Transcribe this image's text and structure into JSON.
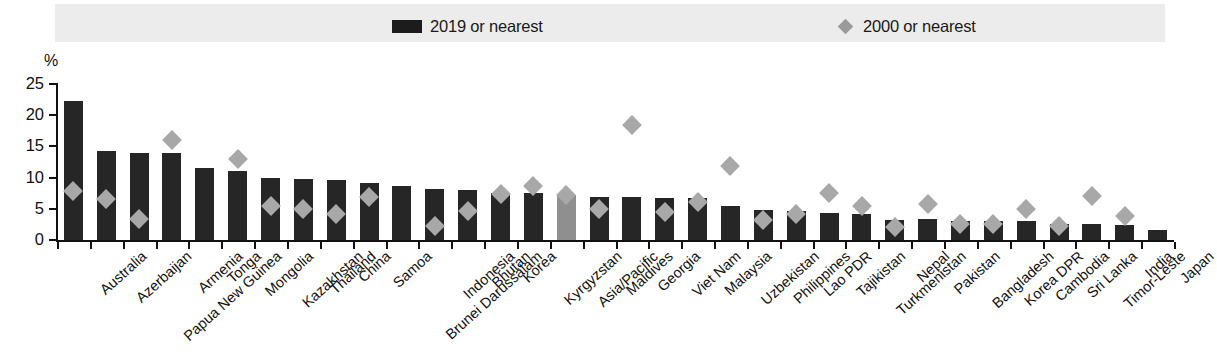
{
  "legend": {
    "items": [
      {
        "label": "2019 or nearest",
        "marker": "bar-swatch-icon",
        "color": "#262626"
      },
      {
        "label": "2000 or nearest",
        "marker": "diamond-marker-icon",
        "color": "#a8a8a8"
      }
    ]
  },
  "axis": {
    "unit_label": "%",
    "y_ticks": [
      "25",
      "20",
      "15",
      "10",
      "5",
      "0"
    ]
  },
  "chart_data": {
    "type": "bar",
    "title": "",
    "subtitle": "",
    "xlabel": "",
    "ylabel": "%",
    "ylim": [
      0,
      25
    ],
    "ytick_values": [
      0,
      5,
      10,
      15,
      20,
      25
    ],
    "grid": false,
    "legend_position": "top",
    "highlight_category": "Asia/Pacific",
    "highlight_color": "#8f8f8f",
    "categories": [
      "Australia",
      "Azerbaijan",
      "Papua New Guinea",
      "Armenia",
      "Tonga",
      "Mongolia",
      "Kazakhstan",
      "Thailand",
      "China",
      "Samoa",
      "Brunei Darussalam",
      "Indonesia",
      "Bhutan",
      "Korea",
      "Kyrgyzstan",
      "Asia/Pacific",
      "Maldives",
      "Georgia",
      "Viet Nam",
      "Malaysia",
      "Uzbekistan",
      "Philippines",
      "Lao PDR",
      "Tajikistan",
      "Turkmenistan",
      "Nepal",
      "Pakistan",
      "Bangladesh",
      "Korea DPR",
      "Cambodia",
      "Sri Lanka",
      "Timor-Leste",
      "India",
      "Japan"
    ],
    "series": [
      {
        "name": "2019 or nearest",
        "type": "bar",
        "color": "#262626",
        "values": [
          22.2,
          14.3,
          13.9,
          13.9,
          11.5,
          11.0,
          9.9,
          9.7,
          9.6,
          9.2,
          8.7,
          8.2,
          8.0,
          7.6,
          7.5,
          7.2,
          6.9,
          6.9,
          6.7,
          6.7,
          5.5,
          4.8,
          4.6,
          4.4,
          4.2,
          3.2,
          3.4,
          3.1,
          3.0,
          3.0,
          2.6,
          2.5,
          2.4,
          1.6
        ]
      },
      {
        "name": "2000 or nearest",
        "type": "scatter",
        "color": "#a8a8a8",
        "values": [
          7.8,
          6.5,
          3.4,
          16.0,
          null,
          13.0,
          5.4,
          5.0,
          4.1,
          6.9,
          null,
          2.3,
          4.7,
          7.4,
          8.7,
          7.2,
          5.0,
          18.5,
          4.5,
          6.1,
          11.8,
          3.2,
          4.2,
          7.6,
          5.4,
          2.1,
          5.8,
          2.6,
          2.6,
          4.9,
          2.3,
          7.0,
          3.9,
          null
        ]
      }
    ]
  }
}
